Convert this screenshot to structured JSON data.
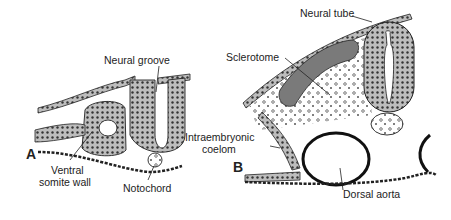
{
  "panels": [
    {
      "id": "A",
      "label": "A",
      "annotations": {
        "neural_groove": "Neural groove",
        "ventral_somite_wall_line1": "Ventral",
        "ventral_somite_wall_line2": "somite wall",
        "notochord": "Notochord"
      }
    },
    {
      "id": "B",
      "label": "B",
      "annotations": {
        "neural_tube": "Neural tube",
        "sclerotome": "Sclerotome",
        "intraembryonic_coelom_line1": "Intraembryonic",
        "intraembryonic_coelom_line2": "coelom",
        "dorsal_aorta": "Dorsal aorta"
      }
    }
  ],
  "colors": {
    "ink": "#222222",
    "tissue_fill": "#8a8a8a",
    "light_fill": "#d9d9d9",
    "background": "#ffffff"
  }
}
